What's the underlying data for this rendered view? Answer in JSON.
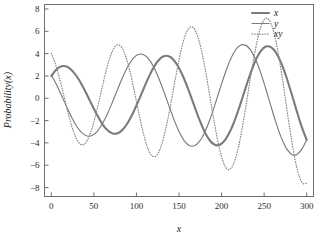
{
  "chart_data": {
    "type": "line",
    "title": "",
    "xlabel": "x",
    "ylabel": "Probability(x)",
    "xlim": [
      -8,
      308
    ],
    "ylim": [
      -8.8,
      8.4
    ],
    "grid": false,
    "legend_position": "upper-right",
    "xticks": [
      0,
      50,
      100,
      150,
      200,
      250,
      300
    ],
    "xtick_labels": [
      "0",
      "50",
      "100",
      "150",
      "200",
      "250",
      "300"
    ],
    "yticks": [
      -8,
      -6,
      -4,
      -2,
      0,
      2,
      4,
      6,
      8
    ],
    "ytick_labels": [
      "-8",
      "-6",
      "-4",
      "-2",
      "0",
      "2",
      "4",
      "6",
      "8"
    ],
    "series": [
      {
        "name": "x",
        "style": "solid",
        "width": 2.1,
        "color": "#7b7b7b",
        "amplitude_start": 2.9,
        "amplitude_end": 4.05,
        "period": 128,
        "phase_deg": 43,
        "x": [
          0,
          6,
          12,
          18,
          24,
          30,
          36,
          42,
          48,
          54,
          60,
          66,
          72,
          78,
          84,
          90,
          96,
          102,
          108,
          114,
          120,
          126,
          132,
          138,
          144,
          150,
          156,
          162,
          168,
          174,
          180,
          186,
          192,
          198,
          204,
          210,
          216,
          222,
          228,
          234,
          240,
          246,
          252,
          258,
          264,
          270,
          276,
          282,
          288,
          294,
          300
        ],
        "y": [
          1.98,
          2.58,
          2.86,
          2.84,
          2.52,
          1.95,
          1.19,
          0.3,
          -0.63,
          -1.53,
          -2.31,
          -2.87,
          -3.15,
          -3.13,
          -2.79,
          -2.17,
          -1.32,
          -0.3,
          0.78,
          1.83,
          2.74,
          3.4,
          3.76,
          3.76,
          3.41,
          2.72,
          1.75,
          0.57,
          -0.69,
          -1.92,
          -2.99,
          -3.76,
          -4.17,
          -4.16,
          -3.75,
          -2.96,
          -1.86,
          -0.54,
          0.87,
          2.23,
          3.4,
          4.22,
          4.63,
          4.58,
          4.08,
          3.17,
          1.93,
          0.47,
          -1.06,
          -2.52,
          -3.73
        ]
      },
      {
        "name": "y",
        "style": "solid",
        "width": 1.15,
        "color": "#7b7b7b",
        "amplitude_start": 3.2,
        "amplitude_end": 3.95,
        "period": 128,
        "phase_deg": -14,
        "x": [
          0,
          6,
          12,
          18,
          24,
          30,
          36,
          42,
          48,
          54,
          60,
          66,
          72,
          78,
          84,
          90,
          96,
          102,
          108,
          114,
          120,
          126,
          132,
          138,
          144,
          150,
          156,
          162,
          168,
          174,
          180,
          186,
          192,
          198,
          204,
          210,
          216,
          222,
          228,
          234,
          240,
          246,
          252,
          258,
          264,
          270,
          276,
          282,
          288,
          294,
          300
        ],
        "y": [
          2.1,
          1.23,
          0.25,
          -0.76,
          -1.72,
          -2.53,
          -3.1,
          -3.38,
          -3.33,
          -2.96,
          -2.29,
          -1.38,
          -0.31,
          0.82,
          1.92,
          2.87,
          3.56,
          3.92,
          3.92,
          3.55,
          2.84,
          1.84,
          0.64,
          -0.64,
          -1.89,
          -2.98,
          -3.79,
          -4.23,
          -4.26,
          -3.87,
          -3.08,
          -1.97,
          -0.62,
          0.81,
          2.2,
          3.41,
          4.28,
          4.75,
          4.76,
          4.33,
          3.47,
          2.27,
          0.83,
          -0.71,
          -2.2,
          -3.5,
          -4.47,
          -5.01,
          -5.06,
          -4.6,
          -3.72
        ]
      },
      {
        "name": "xy",
        "style": "dotted",
        "width": 1.25,
        "color": "#8a8a8a",
        "amplitude_start": 4.3,
        "amplitude_end": 8.1,
        "period": 64,
        "phase_deg": 100,
        "x": [
          0,
          4,
          8,
          12,
          16,
          20,
          24,
          28,
          32,
          36,
          40,
          44,
          48,
          52,
          56,
          60,
          64,
          68,
          72,
          76,
          80,
          84,
          88,
          92,
          96,
          100,
          104,
          108,
          112,
          116,
          120,
          124,
          128,
          132,
          136,
          140,
          144,
          148,
          152,
          156,
          160,
          164,
          168,
          172,
          176,
          180,
          184,
          188,
          192,
          196,
          200,
          204,
          208,
          212,
          216,
          220,
          224,
          228,
          232,
          236,
          240,
          244,
          248,
          252,
          256,
          260,
          264,
          268,
          272,
          276,
          280,
          284,
          288,
          292,
          296,
          300
        ],
        "y": [
          4.02,
          3.25,
          2.25,
          1.08,
          -0.17,
          -1.4,
          -2.5,
          -3.38,
          -3.95,
          -4.17,
          -4.02,
          -3.5,
          -2.65,
          -1.54,
          -0.26,
          1.07,
          2.35,
          3.45,
          4.27,
          4.72,
          4.76,
          4.39,
          3.62,
          2.53,
          1.19,
          -0.29,
          -1.77,
          -3.1,
          -4.19,
          -4.92,
          -5.23,
          -5.09,
          -4.5,
          -3.51,
          -2.19,
          -0.64,
          1.03,
          2.67,
          4.15,
          5.33,
          6.1,
          6.41,
          6.21,
          5.53,
          4.41,
          2.93,
          1.22,
          -0.6,
          -2.38,
          -3.97,
          -5.23,
          -6.06,
          -6.39,
          -6.19,
          -5.48,
          -4.31,
          -2.77,
          -0.98,
          0.92,
          2.79,
          4.47,
          5.83,
          6.76,
          7.16,
          7.0,
          6.29,
          5.07,
          3.44,
          1.51,
          -0.57,
          -2.64,
          -4.53,
          -6.08,
          -7.15,
          -7.66,
          -7.58
        ]
      }
    ]
  },
  "legend": {
    "entries": [
      {
        "label": "x",
        "style": "solid-thick"
      },
      {
        "label": "y",
        "style": "solid-thin"
      },
      {
        "label": "xy",
        "style": "dotted"
      }
    ]
  }
}
